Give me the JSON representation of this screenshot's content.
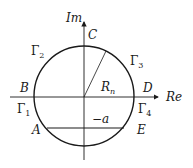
{
  "diagram": {
    "axes": {
      "imag_label": "Im",
      "real_label": "Re"
    },
    "points": {
      "A": "A",
      "B": "B",
      "C": "C",
      "D": "D",
      "E": "E"
    },
    "arcs": {
      "gamma1": {
        "symbol": "Γ",
        "sub": "1"
      },
      "gamma2": {
        "symbol": "Γ",
        "sub": "2"
      },
      "gamma3": {
        "symbol": "Γ",
        "sub": "3"
      },
      "gamma4": {
        "symbol": "Γ",
        "sub": "4"
      }
    },
    "radius_label": {
      "symbol": "R",
      "sub": "n"
    },
    "chord_label": "−a",
    "colors": {
      "stroke": "#1a1a1a",
      "background": "#ffffff"
    }
  }
}
